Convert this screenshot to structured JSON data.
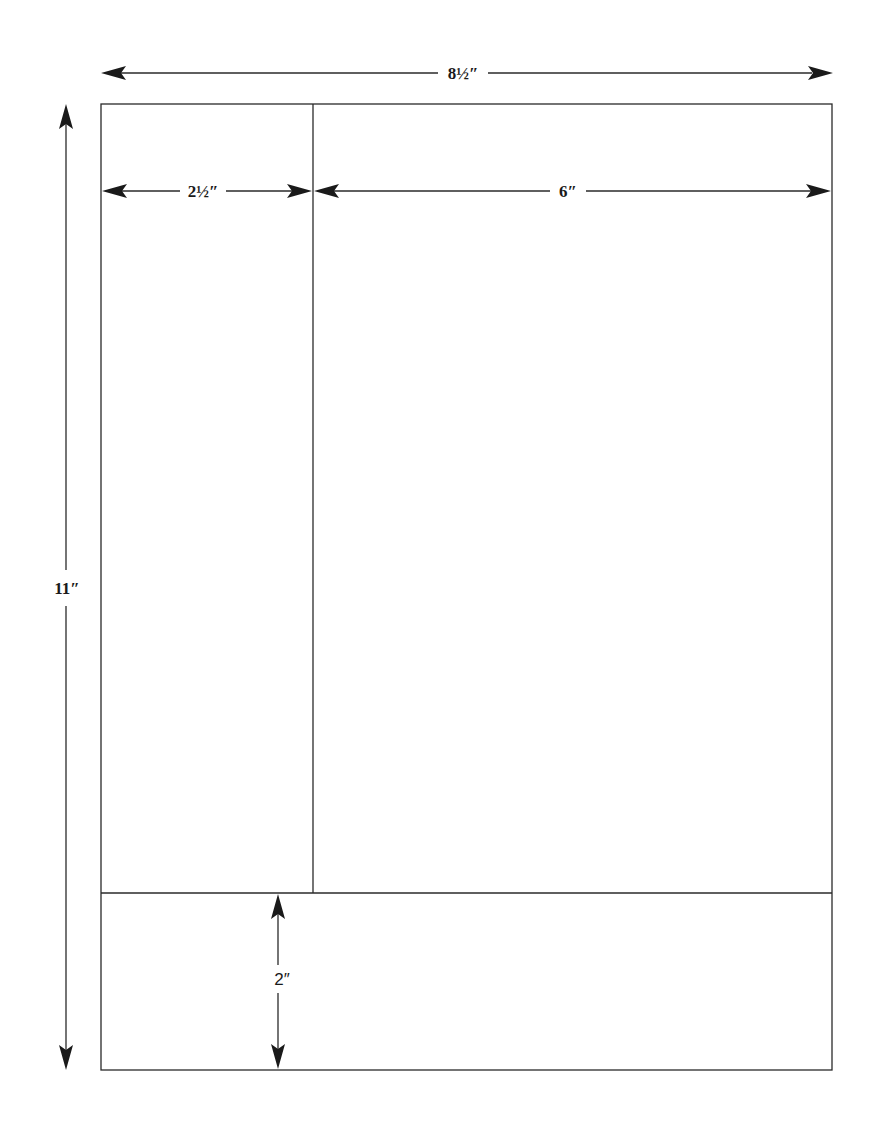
{
  "diagram": {
    "page": {
      "width_label": "8½″",
      "height_label": "11″"
    },
    "regions": {
      "left_column": {
        "width_label": "2½″"
      },
      "main_column": {
        "width_label": "6″"
      },
      "footer": {
        "height_label": "2″"
      }
    },
    "colors": {
      "line": "#2a2a2a",
      "text": "#1a1a1a",
      "background": "#ffffff"
    }
  }
}
